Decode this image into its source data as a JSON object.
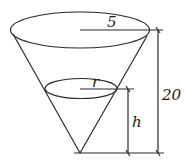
{
  "diagram": {
    "labels": {
      "top_radius": "5",
      "water_radius": "r",
      "water_height": "h",
      "cone_height": "20"
    },
    "colors": {
      "stroke": "#2a2a2a",
      "background": "#ffffff"
    }
  }
}
